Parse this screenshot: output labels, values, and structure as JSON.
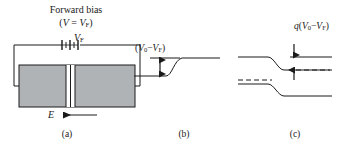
{
  "figure": {
    "title_line1": "Forward bias",
    "title_line2_pre": "(",
    "title_line2_v": "V",
    "title_line2_eq": " = ",
    "title_line2_vf": "V",
    "title_line2_vf_sub": "F",
    "title_line2_post": ")",
    "background_color": "#ffffff",
    "line_color": "#1a1a1a",
    "semiconductor_fill": "#b0b3b5"
  },
  "panel_a": {
    "caption": "(a)",
    "source_label_v": "V",
    "source_label_sub": "F",
    "p_region_label": "p",
    "n_region_label": "n",
    "field_label": "E",
    "field_arrow_direction": "left",
    "component": "battery"
  },
  "panel_b": {
    "caption": "(b)",
    "potential_label_open": "(",
    "potential_label_v0": "V",
    "potential_label_v0_sub": "0",
    "potential_label_minus": "−",
    "potential_label_vf": "V",
    "potential_label_vf_sub": "F",
    "potential_label_close": ")",
    "arrow_type": "double-headed-vertical",
    "curve_shape": "rising-step"
  },
  "panel_c": {
    "caption": "(c)",
    "energy_label_q": "q",
    "energy_label_open": "(",
    "energy_label_v0": "V",
    "energy_label_v0_sub": "0",
    "energy_label_minus": "−",
    "energy_label_vf": "V",
    "energy_label_vf_sub": "F",
    "energy_label_close": ")",
    "bands": [
      {
        "name": "conduction-band",
        "style": "solid"
      },
      {
        "name": "fermi-level-n",
        "style": "dashed"
      },
      {
        "name": "fermi-level-p",
        "style": "dashed"
      },
      {
        "name": "valence-band",
        "style": "solid"
      }
    ],
    "arrow_type": "opposed-vertical-pair"
  }
}
